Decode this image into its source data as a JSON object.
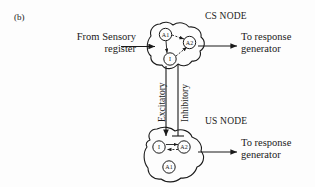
{
  "figure": {
    "panel_label": "(b)",
    "background_color": "#fdfdfd",
    "ink_color": "#1a1a1a"
  },
  "labels": {
    "input_source": "From Sensory\nregister",
    "cs_node_title": "CS NODE",
    "us_node_title": "US NODE",
    "cs_output": "To response\ngenerator",
    "us_output": "To response\ngenerator",
    "excitatory_link": "Excitatory",
    "inhibitory_link": "Inhibitory"
  },
  "nodes": {
    "cs": {
      "title": "CS NODE",
      "units": [
        {
          "id": "cs-a1",
          "label": "A1"
        },
        {
          "id": "cs-a2",
          "label": "A2"
        },
        {
          "id": "cs-i",
          "label": "I"
        }
      ]
    },
    "us": {
      "title": "US NODE",
      "units": [
        {
          "id": "us-i",
          "label": "I"
        },
        {
          "id": "us-a2",
          "label": "A2"
        },
        {
          "id": "us-a1",
          "label": "A1"
        }
      ]
    }
  },
  "connections": [
    {
      "name": "sensory-to-cs",
      "from": "From Sensory register",
      "to": "CS NODE",
      "style": "solid"
    },
    {
      "name": "cs-to-response",
      "from": "CS NODE",
      "to": "To response generator",
      "style": "solid"
    },
    {
      "name": "us-to-response",
      "from": "US NODE",
      "to": "To response generator",
      "style": "solid"
    },
    {
      "name": "cs-to-us-excitatory",
      "from": "CS NODE",
      "to": "US NODE",
      "label": "Excitatory",
      "style": "solid"
    },
    {
      "name": "us-to-cs-inhibitory",
      "from": "US NODE",
      "to": "CS NODE",
      "label": "Inhibitory",
      "style": "solid"
    },
    {
      "name": "cs-a1-to-a2",
      "from": "A1",
      "to": "A2",
      "style": "dashed"
    },
    {
      "name": "cs-a1-to-i",
      "from": "A1",
      "to": "I",
      "style": "solid"
    },
    {
      "name": "cs-i-to-a2",
      "from": "I",
      "to": "A2",
      "style": "dashed"
    },
    {
      "name": "us-i-to-a2",
      "from": "I",
      "to": "A2",
      "style": "solid"
    },
    {
      "name": "us-a2-to-i",
      "from": "A2",
      "to": "I",
      "style": "dashed"
    }
  ]
}
